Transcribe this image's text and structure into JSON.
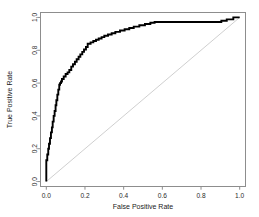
{
  "chart_data": {
    "type": "line",
    "title": "",
    "subtitle": "",
    "xlabel": "False Positive Rate",
    "ylabel": "True Positive Rate",
    "xlim": [
      -0.03,
      1.03
    ],
    "ylim": [
      -0.03,
      1.03
    ],
    "grid": false,
    "legend": null,
    "xticks": [
      0.0,
      0.2,
      0.4,
      0.6,
      0.8,
      1.0
    ],
    "yticks": [
      0.0,
      0.2,
      0.4,
      0.6,
      0.8,
      1.0
    ],
    "xtick_labels": [
      "0.0",
      "0.2",
      "0.4",
      "0.6",
      "0.8",
      "1.0"
    ],
    "ytick_labels": [
      "0.0",
      "0.2",
      "0.4",
      "0.6",
      "0.8",
      "1.0"
    ],
    "series": [
      {
        "name": "ROC curve",
        "color": "#000000",
        "width": 1.9,
        "style": "step",
        "x": [
          0.0,
          0.0,
          0.0,
          0.0,
          0.005,
          0.005,
          0.01,
          0.01,
          0.014,
          0.014,
          0.019,
          0.019,
          0.024,
          0.024,
          0.029,
          0.029,
          0.033,
          0.033,
          0.038,
          0.038,
          0.043,
          0.043,
          0.048,
          0.048,
          0.052,
          0.052,
          0.057,
          0.057,
          0.062,
          0.062,
          0.067,
          0.067,
          0.071,
          0.071,
          0.076,
          0.076,
          0.081,
          0.081,
          0.09,
          0.09,
          0.1,
          0.1,
          0.11,
          0.11,
          0.119,
          0.119,
          0.129,
          0.129,
          0.138,
          0.138,
          0.148,
          0.148,
          0.157,
          0.157,
          0.167,
          0.167,
          0.176,
          0.176,
          0.186,
          0.186,
          0.195,
          0.195,
          0.205,
          0.205,
          0.214,
          0.214,
          0.229,
          0.229,
          0.243,
          0.243,
          0.257,
          0.257,
          0.271,
          0.271,
          0.286,
          0.286,
          0.3,
          0.3,
          0.319,
          0.319,
          0.338,
          0.338,
          0.357,
          0.357,
          0.381,
          0.381,
          0.405,
          0.405,
          0.429,
          0.429,
          0.452,
          0.452,
          0.481,
          0.481,
          0.51,
          0.51,
          0.538,
          0.538,
          0.56,
          0.56,
          0.905,
          0.905,
          0.933,
          0.933,
          0.967,
          0.967,
          1.0
        ],
        "y": [
          0.0,
          0.06,
          0.095,
          0.13,
          0.13,
          0.165,
          0.165,
          0.2,
          0.2,
          0.23,
          0.23,
          0.265,
          0.265,
          0.3,
          0.3,
          0.33,
          0.33,
          0.365,
          0.365,
          0.4,
          0.4,
          0.43,
          0.43,
          0.465,
          0.465,
          0.495,
          0.495,
          0.53,
          0.53,
          0.56,
          0.56,
          0.59,
          0.59,
          0.6,
          0.6,
          0.61,
          0.61,
          0.625,
          0.625,
          0.64,
          0.64,
          0.655,
          0.655,
          0.665,
          0.665,
          0.68,
          0.68,
          0.7,
          0.7,
          0.715,
          0.715,
          0.73,
          0.73,
          0.745,
          0.745,
          0.76,
          0.76,
          0.775,
          0.775,
          0.79,
          0.79,
          0.805,
          0.805,
          0.82,
          0.82,
          0.84,
          0.84,
          0.848,
          0.848,
          0.856,
          0.856,
          0.864,
          0.864,
          0.872,
          0.872,
          0.88,
          0.88,
          0.888,
          0.888,
          0.896,
          0.896,
          0.904,
          0.904,
          0.912,
          0.912,
          0.92,
          0.92,
          0.928,
          0.928,
          0.936,
          0.936,
          0.944,
          0.944,
          0.952,
          0.952,
          0.96,
          0.96,
          0.968,
          0.968,
          0.972,
          0.972,
          0.98,
          0.98,
          0.988,
          0.988,
          1.0,
          1.0
        ]
      },
      {
        "name": "Chance diagonal",
        "color": "#c9c9c9",
        "width": 0.9,
        "style": "line",
        "x": [
          0.0,
          1.0
        ],
        "y": [
          0.0,
          1.0
        ]
      }
    ]
  },
  "axes": {
    "frame_color": "#8d8d8d",
    "tick_color": "#8d8d8d",
    "text_color": "#2b2b2b"
  }
}
